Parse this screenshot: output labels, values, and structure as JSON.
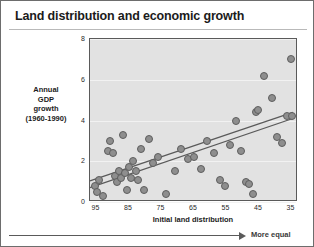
{
  "title": "Land distribution and economic growth",
  "arrow": {
    "label": "More equal",
    "icon": "arrow-right-icon"
  },
  "chart_data": {
    "type": "scatter",
    "title": "Land distribution and economic growth",
    "xlabel": "Initial land distribution",
    "ylabel": "Annual GDP growth (1960-1990)",
    "ylabel_lines": [
      "Annual",
      "GDP",
      "growth",
      "(1960-1990)"
    ],
    "xlim": [
      97,
      33
    ],
    "ylim": [
      0,
      8
    ],
    "x_inverted": true,
    "xticks": [
      95,
      85,
      75,
      65,
      55,
      45,
      35
    ],
    "yticks": [
      0,
      2,
      4,
      6,
      8
    ],
    "grid": true,
    "grid_axis": "y",
    "legend": null,
    "colors": {
      "point_fill": "#8e8e8e",
      "point_edge": "#5e5e5e",
      "plot_background": "#e2e2e2",
      "gridline": "#f2f2f2",
      "trend_line": "#5a5a5a"
    },
    "points": [
      {
        "x": 95.4,
        "y": 0.8
      },
      {
        "x": 94.8,
        "y": 0.5
      },
      {
        "x": 94.2,
        "y": 1.1
      },
      {
        "x": 93.0,
        "y": 0.3
      },
      {
        "x": 91.5,
        "y": 2.5
      },
      {
        "x": 90.8,
        "y": 3.0
      },
      {
        "x": 90.0,
        "y": 2.4
      },
      {
        "x": 89.2,
        "y": 1.3
      },
      {
        "x": 88.6,
        "y": 1.0
      },
      {
        "x": 88.0,
        "y": 1.5
      },
      {
        "x": 87.4,
        "y": 1.2
      },
      {
        "x": 86.8,
        "y": 3.3
      },
      {
        "x": 86.2,
        "y": 1.4
      },
      {
        "x": 85.6,
        "y": 0.6
      },
      {
        "x": 85.0,
        "y": 1.7
      },
      {
        "x": 84.4,
        "y": 1.2
      },
      {
        "x": 83.8,
        "y": 2.0
      },
      {
        "x": 83.0,
        "y": 1.5
      },
      {
        "x": 82.2,
        "y": 1.1
      },
      {
        "x": 81.4,
        "y": 2.6
      },
      {
        "x": 80.5,
        "y": 0.6
      },
      {
        "x": 79.0,
        "y": 3.1
      },
      {
        "x": 77.5,
        "y": 1.9
      },
      {
        "x": 76.0,
        "y": 2.2
      },
      {
        "x": 73.5,
        "y": 0.4
      },
      {
        "x": 71.0,
        "y": 1.5
      },
      {
        "x": 69.0,
        "y": 2.6
      },
      {
        "x": 67.0,
        "y": 2.1
      },
      {
        "x": 65.0,
        "y": 2.2
      },
      {
        "x": 63.0,
        "y": 1.6
      },
      {
        "x": 61.0,
        "y": 3.0
      },
      {
        "x": 59.0,
        "y": 2.4
      },
      {
        "x": 57.0,
        "y": 1.1
      },
      {
        "x": 55.5,
        "y": 0.8
      },
      {
        "x": 54.0,
        "y": 2.8
      },
      {
        "x": 52.0,
        "y": 4.0
      },
      {
        "x": 50.5,
        "y": 2.5
      },
      {
        "x": 49.0,
        "y": 1.0
      },
      {
        "x": 48.0,
        "y": 0.9
      },
      {
        "x": 47.0,
        "y": 0.4
      },
      {
        "x": 46.0,
        "y": 4.4
      },
      {
        "x": 45.2,
        "y": 4.5
      },
      {
        "x": 43.5,
        "y": 6.2
      },
      {
        "x": 41.0,
        "y": 5.1
      },
      {
        "x": 39.5,
        "y": 3.2
      },
      {
        "x": 38.0,
        "y": 2.9
      },
      {
        "x": 36.5,
        "y": 4.2
      },
      {
        "x": 35.2,
        "y": 7.0
      },
      {
        "x": 35.0,
        "y": 4.2
      }
    ],
    "trend_lines": [
      {
        "name": "fit-upper",
        "x0": 97,
        "y0": 0.95,
        "x1": 34,
        "y1": 4.35
      },
      {
        "name": "fit-lower",
        "x0": 97,
        "y0": 0.62,
        "x1": 34,
        "y1": 4.05
      }
    ]
  }
}
